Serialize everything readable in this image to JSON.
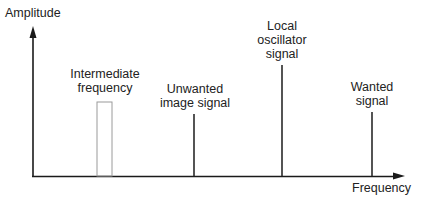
{
  "diagram": {
    "axes": {
      "y_label": "Amplitude",
      "x_label": "Frequency"
    },
    "components": [
      {
        "id": "intermediate-frequency",
        "label_lines": [
          "Intermediate",
          "frequency"
        ],
        "shape": "outlined-rectangle",
        "relative_height": "low"
      },
      {
        "id": "unwanted-image-signal",
        "label_lines": [
          "Unwanted",
          "image signal"
        ],
        "shape": "line",
        "relative_height": "medium"
      },
      {
        "id": "local-oscillator-signal",
        "label_lines": [
          "Local",
          "oscillator",
          "signal"
        ],
        "shape": "line",
        "relative_height": "tallest"
      },
      {
        "id": "wanted-signal",
        "label_lines": [
          "Wanted",
          "signal"
        ],
        "shape": "line",
        "relative_height": "medium"
      }
    ],
    "colors": {
      "axis": "#1a1a1a",
      "signal_line": "#2a2a2a",
      "if_box": "#9a9a9a",
      "text": "#222222",
      "background": "#ffffff"
    }
  }
}
